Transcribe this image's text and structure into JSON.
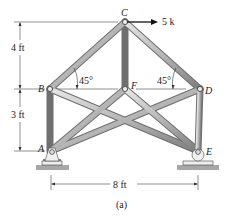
{
  "figure": {
    "caption": "(a)",
    "nodes": {
      "A": {
        "label": "A",
        "x": 51,
        "y": 151
      },
      "B": {
        "label": "B",
        "x": 50,
        "y": 89
      },
      "C": {
        "label": "C",
        "x": 125,
        "y": 22
      },
      "D": {
        "label": "D",
        "x": 200,
        "y": 89
      },
      "E": {
        "label": "E",
        "x": 198,
        "y": 151
      },
      "F": {
        "label": "F",
        "x": 125,
        "y": 89
      }
    },
    "load": {
      "label": "5 k",
      "direction": "right",
      "at": "C"
    },
    "angles": {
      "left": "45°",
      "right": "45°"
    },
    "dimensions": {
      "upper_height": "4 ft",
      "lower_height": "3 ft",
      "span": "8 ft"
    },
    "supports": {
      "A": "pin",
      "E": "roller"
    },
    "colors": {
      "member_light": "#d9d9d9",
      "member_dark": "#8a8a8a",
      "ground": "#a7a7a7",
      "line": "#333333"
    }
  }
}
